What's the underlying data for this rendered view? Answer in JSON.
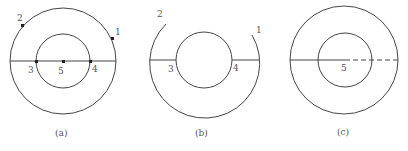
{
  "figures": [
    {
      "id": "a",
      "caption": "(a)",
      "points": {
        "p1": "1",
        "p2": "2",
        "p3": "3",
        "p4": "4",
        "p5": "5"
      }
    },
    {
      "id": "b",
      "caption": "(b)",
      "points": {
        "p1": "1",
        "p2": "2",
        "p3": "3",
        "p4": "4"
      }
    },
    {
      "id": "c",
      "caption": "(c)",
      "points": {
        "p5": "5"
      }
    }
  ],
  "colors": {
    "stroke": "#444444",
    "text": "#555555"
  }
}
